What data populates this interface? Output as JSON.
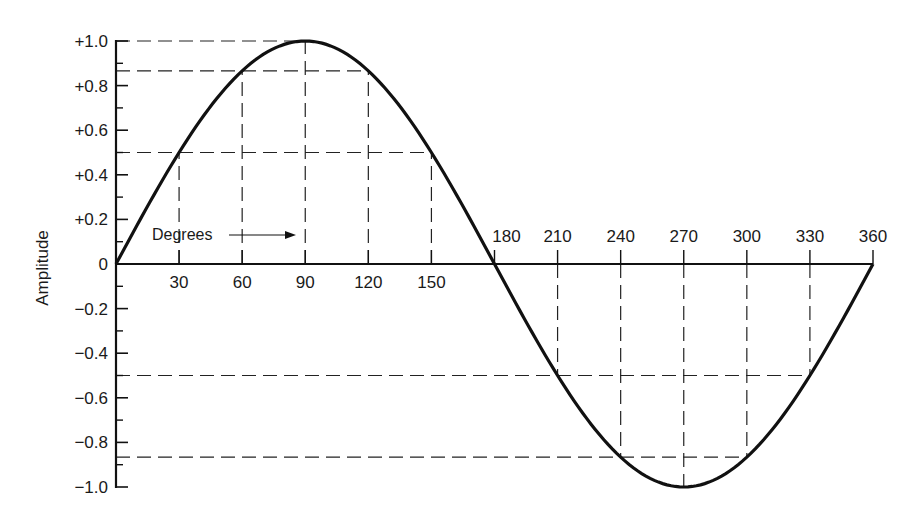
{
  "chart_data": {
    "type": "line",
    "title": "",
    "xlabel": "Degrees",
    "ylabel": "Amplitude",
    "xlim": [
      0,
      360
    ],
    "ylim": [
      -1.0,
      1.0
    ],
    "x_ticks": [
      30,
      60,
      90,
      120,
      150,
      180,
      210,
      240,
      270,
      300,
      330,
      360
    ],
    "x_tick_labels": [
      "30",
      "60",
      "90",
      "120",
      "150",
      "180",
      "210",
      "240",
      "270",
      "300",
      "330",
      "360"
    ],
    "y_ticks": [
      1.0,
      0.8,
      0.6,
      0.4,
      0.2,
      0,
      -0.2,
      -0.4,
      -0.6,
      -0.8,
      -1.0
    ],
    "y_tick_labels": [
      "+1.0",
      "+0.8",
      "+0.6",
      "+0.4",
      "+0.2",
      "0",
      "-0.2",
      "-0.4",
      "-0.6",
      "-0.8",
      "-1.0"
    ],
    "y_minor_ticks": [
      0.9,
      0.7,
      0.5,
      0.3,
      0.1,
      -0.1,
      -0.3,
      -0.5,
      -0.7,
      -0.9
    ],
    "grid": false,
    "series": [
      {
        "name": "sine wave",
        "x": [
          0,
          30,
          60,
          90,
          120,
          150,
          180,
          210,
          240,
          270,
          300,
          330,
          360
        ],
        "values": [
          0,
          0.5,
          0.866,
          1.0,
          0.866,
          0.5,
          0,
          -0.5,
          -0.866,
          -1.0,
          -0.866,
          -0.5,
          0
        ]
      }
    ],
    "reference_lines": {
      "horizontal": [
        1.0,
        0.866,
        0.5,
        -0.5,
        -0.866
      ],
      "vertical": [
        30,
        60,
        90,
        120,
        150,
        210,
        240,
        270,
        300,
        330
      ]
    },
    "annotations": [
      {
        "text": "Degrees",
        "arrow_to_x": 90,
        "y": 0.15
      }
    ]
  }
}
